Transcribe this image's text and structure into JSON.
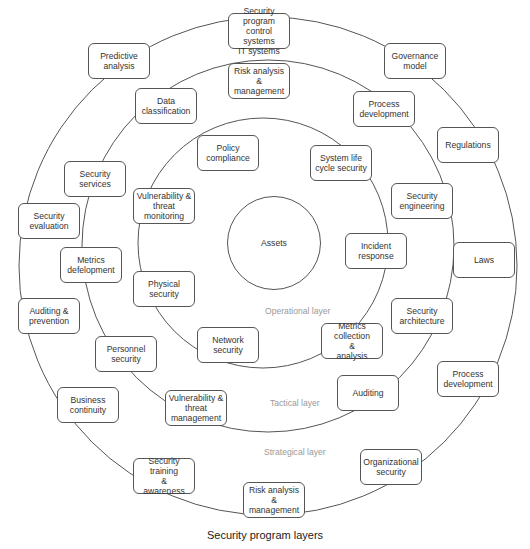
{
  "diagram": {
    "title": "Security program layers",
    "center": {
      "label": "Assets"
    },
    "layers": [
      {
        "name": "Operational layer",
        "nodes": [
          {
            "id": "policy-compliance",
            "label": "Policy\ncompliance"
          },
          {
            "id": "system-life-cycle-security",
            "label": "System life\ncycle security"
          },
          {
            "id": "incident-response",
            "label": "Incident\nresponse"
          },
          {
            "id": "metrics-collection-analysis",
            "label": "Metrics collection\n&\nanalysis"
          },
          {
            "id": "network-security",
            "label": "Network\nsecurity"
          },
          {
            "id": "physical-security",
            "label": "Physical\nsecurity"
          },
          {
            "id": "vulnerability-threat-monitoring",
            "label": "Vulnerability &\nthreat monitoring"
          }
        ]
      },
      {
        "name": "Tactical layer",
        "nodes": [
          {
            "id": "risk-analysis-management-top",
            "label": "Risk analysis &\nmanagement"
          },
          {
            "id": "process-development-top",
            "label": "Process\ndevelopment"
          },
          {
            "id": "security-engineering",
            "label": "Security\nengineering"
          },
          {
            "id": "security-architecture",
            "label": "Security\narchitecture"
          },
          {
            "id": "auditing",
            "label": "Auditing"
          },
          {
            "id": "vulnerability-threat-management",
            "label": "Vulnerability &\nthreat\nmanagement"
          },
          {
            "id": "personnel-security",
            "label": "Personnel\nsecurity"
          },
          {
            "id": "metrics-defelopment",
            "label": "Metrics\ndefelopment"
          },
          {
            "id": "security-services",
            "label": "Security\nservices"
          },
          {
            "id": "data-classification",
            "label": "Data\nclassification"
          }
        ]
      },
      {
        "name": "Strategical layer",
        "nodes": [
          {
            "id": "security-program",
            "label": "Security program\ncontrol systems\nIT systems"
          },
          {
            "id": "governance-model",
            "label": "Governance\nmodel"
          },
          {
            "id": "regulations",
            "label": "Regulations"
          },
          {
            "id": "laws",
            "label": "Laws"
          },
          {
            "id": "process-development-bottom",
            "label": "Process\ndevelopment"
          },
          {
            "id": "organizational-security",
            "label": "Organizational\nsecurity"
          },
          {
            "id": "risk-analysis-management-bottom",
            "label": "Risk analysis &\nmanagement"
          },
          {
            "id": "security-training-awareness",
            "label": "Security training\n&\nawareness"
          },
          {
            "id": "business-continuity",
            "label": "Business\ncontinuity"
          },
          {
            "id": "auditing-prevention",
            "label": "Auditing &\nprevention"
          },
          {
            "id": "security-evaluation",
            "label": "Security\nevaluation"
          },
          {
            "id": "predictive-analysis",
            "label": "Predictive\nanalysis"
          }
        ]
      }
    ]
  }
}
